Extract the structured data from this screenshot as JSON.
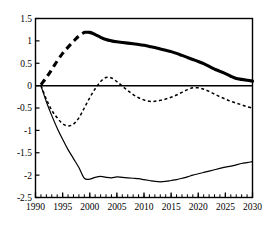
{
  "chart_data": {
    "type": "line",
    "title": "",
    "subtitle": "",
    "xlabel": "",
    "ylabel": "",
    "xlim": [
      1990,
      2030
    ],
    "ylim": [
      -2.5,
      1.5
    ],
    "grid": false,
    "legend": "none",
    "axis": {
      "y_ticks": [
        1.5,
        1,
        0.5,
        0,
        -0.5,
        -1,
        -1.5,
        -2,
        -2.5
      ],
      "y_tick_labels": [
        "1.5",
        "1",
        "0.5",
        "0",
        "-0.5",
        "-1",
        "-1.5",
        "-2",
        "-2.5"
      ],
      "x_ticks": [
        1990,
        1995,
        2000,
        2005,
        2010,
        2015,
        2020,
        2025,
        2030
      ],
      "x_tick_labels": [
        "1990",
        "1995",
        "2000",
        "2005",
        "2010",
        "2015",
        "2020",
        "2025",
        "2030"
      ],
      "x_minor_tick_step": 1,
      "zero_line": 0
    },
    "x": [
      1991,
      1992,
      1993,
      1994,
      1995,
      1996,
      1997,
      1998,
      1999,
      2000,
      2001,
      2002,
      2003,
      2004,
      2005,
      2006,
      2007,
      2008,
      2009,
      2010,
      2011,
      2012,
      2013,
      2014,
      2015,
      2016,
      2017,
      2018,
      2019,
      2020,
      2021,
      2022,
      2023,
      2024,
      2025,
      2026,
      2027,
      2028,
      2029,
      2030
    ],
    "series": [
      {
        "name": "thick-upper-series",
        "style": "thick-solid-with-dashed-head",
        "color": "#000000",
        "line_width": 3.1,
        "dashed_until_year": 1999,
        "values": [
          0.02,
          0.18,
          0.36,
          0.55,
          0.72,
          0.86,
          0.99,
          1.11,
          1.19,
          1.19,
          1.14,
          1.08,
          1.03,
          1.0,
          0.98,
          0.965,
          0.95,
          0.935,
          0.92,
          0.9,
          0.875,
          0.85,
          0.82,
          0.79,
          0.76,
          0.72,
          0.675,
          0.63,
          0.585,
          0.54,
          0.49,
          0.43,
          0.37,
          0.32,
          0.27,
          0.21,
          0.16,
          0.14,
          0.12,
          0.1
        ]
      },
      {
        "name": "dotted-middle-series",
        "style": "dotted",
        "color": "#000000",
        "line_width": 1.5,
        "values": [
          0.0,
          -0.3,
          -0.55,
          -0.72,
          -0.85,
          -0.9,
          -0.86,
          -0.72,
          -0.5,
          -0.27,
          -0.07,
          0.09,
          0.18,
          0.17,
          0.09,
          -0.01,
          -0.11,
          -0.2,
          -0.27,
          -0.32,
          -0.35,
          -0.35,
          -0.33,
          -0.3,
          -0.26,
          -0.21,
          -0.15,
          -0.09,
          -0.05,
          -0.05,
          -0.08,
          -0.13,
          -0.19,
          -0.25,
          -0.3,
          -0.35,
          -0.39,
          -0.43,
          -0.47,
          -0.5
        ]
      },
      {
        "name": "thin-lower-series",
        "style": "thin-solid",
        "color": "#000000",
        "line_width": 1.2,
        "values": [
          0.0,
          -0.36,
          -0.67,
          -0.95,
          -1.2,
          -1.43,
          -1.63,
          -1.83,
          -2.07,
          -2.09,
          -2.05,
          -2.03,
          -2.05,
          -2.06,
          -2.04,
          -2.05,
          -2.06,
          -2.07,
          -2.08,
          -2.1,
          -2.12,
          -2.14,
          -2.15,
          -2.14,
          -2.12,
          -2.1,
          -2.07,
          -2.04,
          -2.0,
          -1.97,
          -1.94,
          -1.91,
          -1.88,
          -1.85,
          -1.82,
          -1.8,
          -1.77,
          -1.74,
          -1.72,
          -1.7
        ]
      }
    ]
  }
}
